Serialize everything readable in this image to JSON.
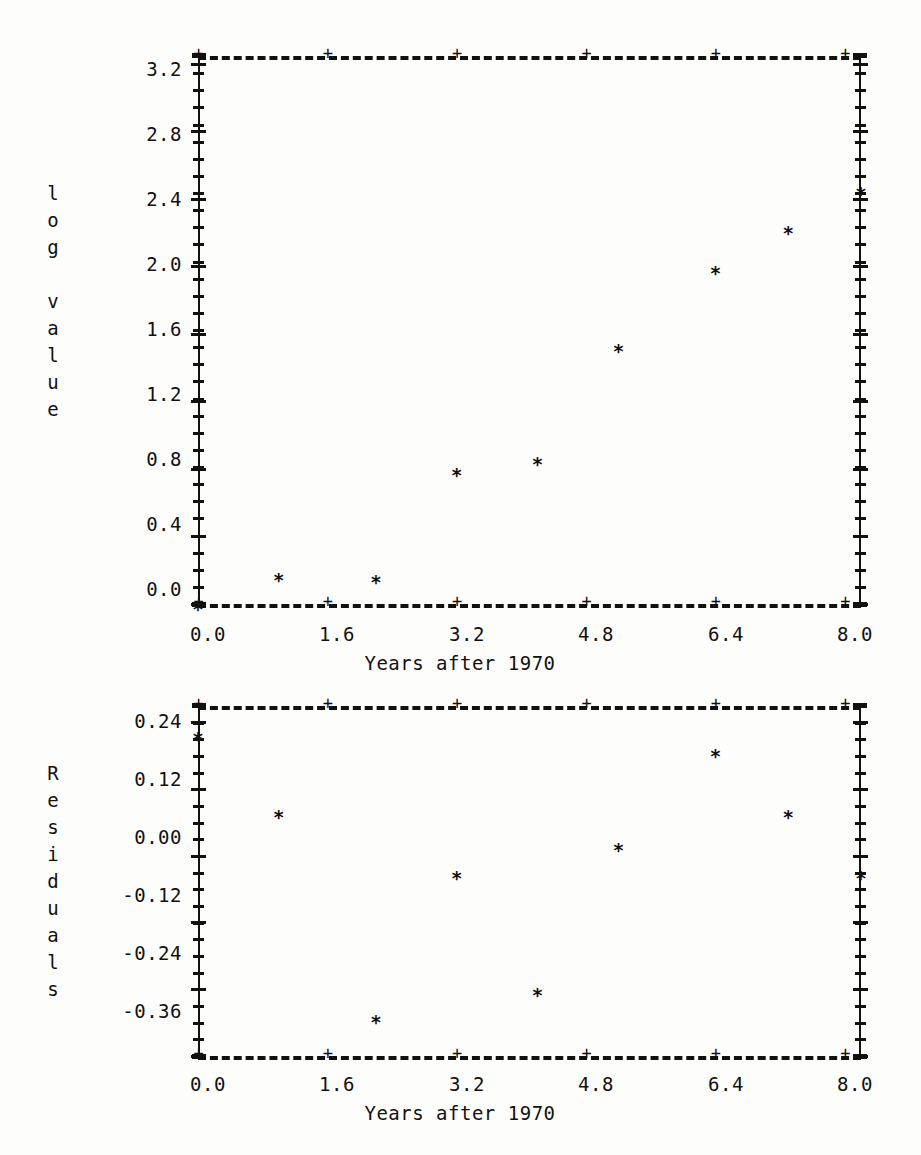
{
  "document": {
    "kind": "statistical-plot-printout",
    "background_color": "#fdfdfc",
    "ink_color": "#111111",
    "marker_glyph": "*",
    "tick_glyph": "+"
  },
  "chart_data": [
    {
      "type": "scatter",
      "id": "log-value-plot",
      "title": "",
      "xlabel": "Years after 1970",
      "ylabel": "log value",
      "ylabel_letters": [
        "l",
        "o",
        "g",
        "",
        "v",
        "a",
        "l",
        "u",
        "e"
      ],
      "xlim": [
        0.0,
        8.2
      ],
      "ylim": [
        0.0,
        3.25
      ],
      "xticks": [
        0.0,
        1.6,
        3.2,
        4.8,
        6.4,
        8.0
      ],
      "xticklabels": [
        "0.0",
        "1.6",
        "3.2",
        "4.8",
        "6.4",
        "8.0"
      ],
      "yticks": [
        0.0,
        0.4,
        0.8,
        1.2,
        1.6,
        2.0,
        2.4,
        2.8,
        3.2
      ],
      "yticklabels": [
        "0.0",
        "0.4",
        "0.8",
        "1.2",
        "1.6",
        "2.0",
        "2.4",
        "2.8",
        "3.2"
      ],
      "grid": false,
      "legend": false,
      "x": [
        0.0,
        1.0,
        2.2,
        3.2,
        4.2,
        5.2,
        6.4,
        7.3,
        8.2
      ],
      "values": [
        0.02,
        0.19,
        0.18,
        0.81,
        0.88,
        1.55,
        2.01,
        2.25,
        2.48
      ],
      "points": [
        {
          "x": 0.0,
          "y": 0.02
        },
        {
          "x": 1.0,
          "y": 0.19
        },
        {
          "x": 2.2,
          "y": 0.18
        },
        {
          "x": 3.2,
          "y": 0.81
        },
        {
          "x": 4.2,
          "y": 0.88
        },
        {
          "x": 5.2,
          "y": 1.55
        },
        {
          "x": 6.4,
          "y": 2.01
        },
        {
          "x": 7.3,
          "y": 2.25
        },
        {
          "x": 8.2,
          "y": 2.48
        }
      ]
    },
    {
      "type": "scatter",
      "id": "residuals-plot",
      "title": "",
      "xlabel": "Years after 1970",
      "ylabel": "Residuals",
      "ylabel_letters": [
        "R",
        "e",
        "s",
        "i",
        "d",
        "u",
        "a",
        "l",
        "s"
      ],
      "xlim": [
        0.0,
        8.2
      ],
      "ylim": [
        -0.36,
        0.27
      ],
      "xticks": [
        0.0,
        1.6,
        3.2,
        4.8,
        6.4,
        8.0
      ],
      "xticklabels": [
        "0.0",
        "1.6",
        "3.2",
        "4.8",
        "6.4",
        "8.0"
      ],
      "yticks": [
        -0.36,
        -0.24,
        -0.12,
        0.0,
        0.12,
        0.24
      ],
      "yticklabels": [
        "-0.36",
        "-0.24",
        "-0.12",
        "0.00",
        "0.12",
        "0.24"
      ],
      "grid": false,
      "legend": false,
      "x": [
        0.0,
        1.0,
        2.2,
        3.2,
        4.2,
        5.2,
        6.4,
        7.3,
        8.2
      ],
      "values": [
        0.225,
        0.085,
        -0.285,
        -0.025,
        -0.235,
        0.025,
        0.195,
        0.085,
        -0.025
      ],
      "points": [
        {
          "x": 0.0,
          "y": 0.225
        },
        {
          "x": 1.0,
          "y": 0.085
        },
        {
          "x": 2.2,
          "y": -0.285
        },
        {
          "x": 3.2,
          "y": -0.025
        },
        {
          "x": 4.2,
          "y": -0.235
        },
        {
          "x": 5.2,
          "y": 0.025
        },
        {
          "x": 6.4,
          "y": 0.195
        },
        {
          "x": 7.3,
          "y": 0.085
        },
        {
          "x": 8.2,
          "y": -0.025
        }
      ]
    }
  ]
}
